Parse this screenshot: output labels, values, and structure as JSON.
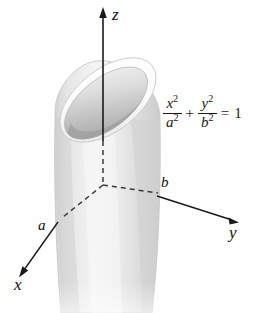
{
  "figure": {
    "background_color": "#fefefe"
  },
  "axes": {
    "z": {
      "label": "z",
      "direction": "up"
    },
    "y": {
      "label": "y",
      "direction": "right-down"
    },
    "x": {
      "label": "x",
      "direction": "left-down"
    },
    "origin_marker": "origin"
  },
  "parameters": {
    "a": {
      "label": "a",
      "meaning": "semi-axis along x"
    },
    "b": {
      "label": "b",
      "meaning": "semi-axis along y"
    }
  },
  "equation": {
    "term1_num_var": "x",
    "term1_num_exp": "2",
    "term1_den_var": "a",
    "term1_den_exp": "2",
    "operator": "+",
    "term2_num_var": "y",
    "term2_num_exp": "2",
    "term2_den_var": "b",
    "term2_den_exp": "2",
    "equals": "=",
    "rhs": "1",
    "plain_text": "x^2/a^2 + y^2/b^2 = 1"
  },
  "surface": {
    "name": "elliptic-cylinder",
    "fill_light": "#f2f2f2",
    "fill_mid": "#dcdcdc",
    "fill_dark": "#b9b9b9",
    "rim_dark": "#a9a9a9",
    "stroke": "#c9c9c9"
  },
  "colors": {
    "axis_line": "#1a1a1a",
    "dashed_line": "#3a3a3a",
    "text": "#111111"
  }
}
